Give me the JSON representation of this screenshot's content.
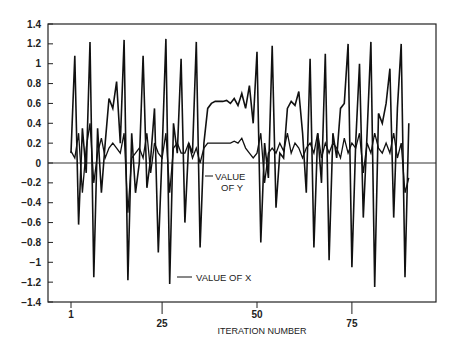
{
  "chart_data": {
    "type": "line",
    "title": "",
    "xlabel": "ITERATION NUMBER",
    "ylabel": "",
    "xlim": [
      -5,
      95
    ],
    "ylim": [
      -1.4,
      1.4
    ],
    "x_ticks": [
      1,
      25,
      50,
      75
    ],
    "y_ticks": [
      1.4,
      1.2,
      1,
      0.8,
      0.6,
      0.4,
      0.2,
      0,
      -0.2,
      -0.4,
      -0.6,
      -0.8,
      -1,
      -1.2,
      -1.4
    ],
    "y_tick_labels": [
      "1.4",
      "1.2",
      "1",
      "0.8",
      "0.6",
      "0.4",
      "0.2",
      "0",
      "−0.2",
      "−0.4",
      "−0.6",
      "−0.8",
      "−1",
      "−1.2",
      "−1.4"
    ],
    "grid": false,
    "zero_line": true,
    "legend": "inline annotations",
    "annotations": [
      {
        "text_line1": "VALUE",
        "text_line2": "OF Y",
        "series": "VALUE OF Y"
      },
      {
        "text_line1": "VALUE OF X",
        "text_line2": "",
        "series": "VALUE OF X"
      }
    ],
    "x": [
      1,
      2,
      3,
      4,
      5,
      6,
      7,
      8,
      9,
      10,
      11,
      12,
      13,
      14,
      15,
      16,
      17,
      18,
      19,
      20,
      21,
      22,
      23,
      24,
      25,
      26,
      27,
      28,
      29,
      30,
      31,
      32,
      33,
      34,
      35,
      36,
      37,
      38,
      39,
      40,
      41,
      42,
      43,
      44,
      45,
      46,
      47,
      48,
      49,
      50,
      51,
      52,
      53,
      54,
      55,
      56,
      57,
      58,
      59,
      60,
      61,
      62,
      63,
      64,
      65,
      66,
      67,
      68,
      69,
      70,
      71,
      72,
      73,
      74,
      75,
      76,
      77,
      78,
      79,
      80,
      81,
      82,
      83,
      84,
      85,
      86,
      87,
      88,
      89,
      90
    ],
    "series": [
      {
        "name": "VALUE OF X",
        "values": [
          0.1,
          1.08,
          -0.62,
          0.35,
          -0.1,
          1.22,
          -1.15,
          0.35,
          -0.3,
          0.2,
          0.65,
          0.55,
          0.82,
          0.2,
          1.24,
          -1.18,
          0.3,
          -0.3,
          0.0,
          1.08,
          -0.25,
          0.05,
          0.55,
          -0.9,
          0.1,
          1.25,
          -1.22,
          0.4,
          0.1,
          1.05,
          -0.6,
          0.2,
          0.1,
          1.22,
          -0.85,
          0.2,
          0.55,
          0.6,
          0.62,
          0.62,
          0.62,
          0.63,
          0.6,
          0.65,
          0.58,
          0.7,
          0.55,
          0.78,
          0.4,
          1.12,
          -0.8,
          0.2,
          -0.15,
          1.18,
          -0.45,
          0.1,
          0.05,
          0.55,
          0.62,
          0.58,
          0.72,
          0.3,
          -0.3,
          1.05,
          -0.85,
          0.3,
          -0.2,
          1.1,
          -0.98,
          0.3,
          0.05,
          0.55,
          0.6,
          1.2,
          -1.05,
          0.2,
          1.0,
          -0.55,
          0.3,
          1.22,
          -1.25,
          0.5,
          0.4,
          0.6,
          0.95,
          -0.55,
          0.55,
          1.2,
          -1.15,
          0.4
        ]
      },
      {
        "name": "VALUE OF Y",
        "values": [
          0.12,
          0.05,
          0.3,
          -0.3,
          0.15,
          0.4,
          -0.2,
          0.1,
          0.25,
          0.05,
          0.15,
          0.2,
          0.15,
          0.1,
          0.3,
          -0.5,
          0.05,
          0.1,
          0.15,
          0.05,
          0.3,
          -0.1,
          0.2,
          0.1,
          0.05,
          0.3,
          -0.3,
          0.15,
          0.2,
          0.1,
          0.1,
          0.2,
          0.05,
          0.15,
          0.0,
          0.15,
          0.2,
          0.2,
          0.2,
          0.2,
          0.2,
          0.2,
          0.2,
          0.22,
          0.2,
          0.25,
          0.15,
          0.1,
          0.05,
          0.1,
          0.3,
          -0.2,
          0.1,
          0.15,
          0.1,
          0.2,
          0.12,
          0.3,
          0.1,
          0.2,
          0.15,
          0.05,
          0.15,
          0.2,
          0.1,
          0.3,
          0.05,
          0.2,
          0.1,
          0.2,
          0.15,
          0.05,
          0.25,
          0.1,
          0.2,
          0.15,
          0.3,
          -0.1,
          0.2,
          0.1,
          0.3,
          0.15,
          0.1,
          0.2,
          0.1,
          0.3,
          0.05,
          0.2,
          -0.3,
          -0.15
        ]
      }
    ]
  }
}
